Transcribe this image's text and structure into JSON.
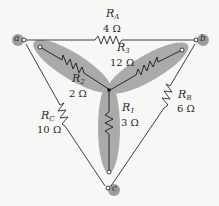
{
  "diagram": {
    "type": "delta-wye circuit",
    "nodes": [
      {
        "id": "a",
        "label": "a"
      },
      {
        "id": "b",
        "label": "b"
      },
      {
        "id": "c",
        "label": "c"
      }
    ],
    "delta_resistors": [
      {
        "name": "R",
        "sub": "A",
        "value": "4 Ω",
        "between": "a-b"
      },
      {
        "name": "R",
        "sub": "B",
        "value": "6 Ω",
        "between": "b-c"
      },
      {
        "name": "R",
        "sub": "C",
        "value": "10 Ω",
        "between": "a-c"
      }
    ],
    "wye_resistors": [
      {
        "name": "R",
        "sub": "1",
        "value": "3 Ω",
        "to": "c"
      },
      {
        "name": "R",
        "sub": "2",
        "value": "2 Ω",
        "to": "a"
      },
      {
        "name": "R",
        "sub": "3",
        "value": "12 Ω",
        "to": "b"
      }
    ],
    "colors": {
      "background": "#f7f7f5",
      "lobe": "#9a9a9a",
      "wire": "#2a2a2a"
    }
  }
}
